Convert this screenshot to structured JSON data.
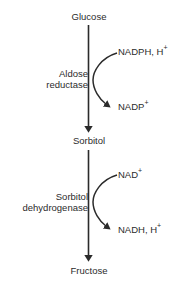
{
  "diagram": {
    "colors": {
      "text": "#2b2b2b",
      "stroke": "#2b2b2b",
      "background": "#ffffff"
    },
    "metabolites": [
      {
        "id": "glucose",
        "label": "Glucose"
      },
      {
        "id": "sorbitol",
        "label": "Sorbitol"
      },
      {
        "id": "fructose",
        "label": "Fructose"
      }
    ],
    "enzymes": [
      {
        "id": "aldose-reductase",
        "line1": "Aldose",
        "line2": "reductase"
      },
      {
        "id": "sorbitol-dehydrogenase",
        "line1": "Sorbitol",
        "line2": "dehydrogenase"
      }
    ],
    "cofactors": [
      {
        "id": "nadph",
        "base": "NADPH, H",
        "sup": "+"
      },
      {
        "id": "nadp",
        "base": "NADP",
        "sup": "+"
      },
      {
        "id": "nad",
        "base": "NAD",
        "sup": "+"
      },
      {
        "id": "nadh",
        "base": "NADH, H",
        "sup": "+"
      }
    ]
  }
}
